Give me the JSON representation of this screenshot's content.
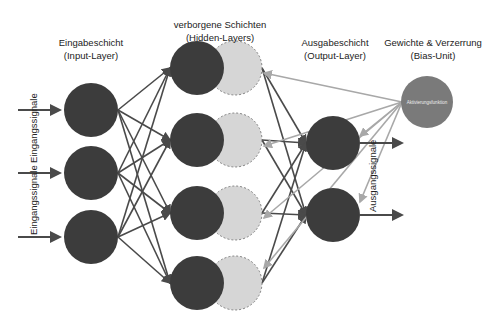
{
  "labels": {
    "input_layer_title": "Eingabeschicht",
    "input_layer_sub": "(Input-Layer)",
    "hidden_layer_title": "verborgene Schichten",
    "hidden_layer_sub": "(Hidden-Layers)",
    "output_layer_title": "Ausgabeschicht",
    "output_layer_sub": "(Output-Layer)",
    "bias_title": "Gewichte & Verzerrung",
    "bias_sub": "(Bias-Unit)",
    "bias_node_text": "Aktivierungsfunktion",
    "input_signals_1": "Eingangssignale",
    "input_signals_2": "Eingangssignale",
    "output_signals": "Ausgangssignale"
  },
  "colors": {
    "node_dark": "#3c3c3c",
    "node_light": "#d6d6d6",
    "bias_node": "#7a7a7a",
    "edge_dark": "#4a4a4a",
    "edge_light": "#a8a8a8"
  }
}
